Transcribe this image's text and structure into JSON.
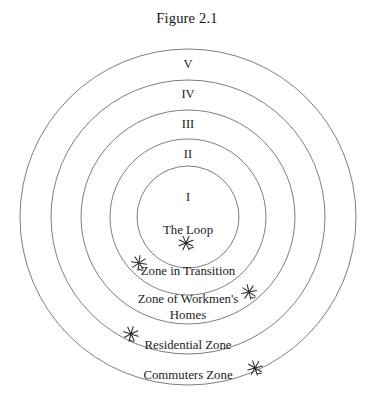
{
  "figure": {
    "title": "Figure 2.1",
    "diagram_type": "concentric-zone-model",
    "background_color": "#ffffff",
    "line_color": "#6e6e6e",
    "text_color": "#1b1b1b",
    "center": {
      "x": 188,
      "y": 217
    },
    "rings": [
      {
        "numeral": "I",
        "radius": 51,
        "numeral_x": 188,
        "numeral_y": 201,
        "zone_label": "The Loop",
        "label_lines": [
          "The Loop"
        ],
        "label_x": 188,
        "label_y": 234
      },
      {
        "numeral": "II",
        "radius": 78,
        "numeral_x": 188,
        "numeral_y": 158,
        "zone_label": "Zone in Transition",
        "label_lines": [
          "Zone in Transition"
        ],
        "label_x": 188,
        "label_y": 275
      },
      {
        "numeral": "III",
        "radius": 107,
        "numeral_x": 188,
        "numeral_y": 128,
        "zone_label": "Zone of Workmen's Homes",
        "label_lines": [
          "Zone of Workmen's",
          "Homes"
        ],
        "label_x": 188,
        "label_y": 307
      },
      {
        "numeral": "IV",
        "radius": 137,
        "numeral_x": 188,
        "numeral_y": 98,
        "zone_label": "Residential Zone",
        "label_lines": [
          "Residential Zone"
        ],
        "label_x": 188,
        "label_y": 349
      },
      {
        "numeral": "V",
        "radius": 168,
        "numeral_x": 188,
        "numeral_y": 68,
        "zone_label": "Commuters Zone",
        "label_lines": [
          "Commuters Zone"
        ],
        "label_x": 188,
        "label_y": 379
      }
    ],
    "star_marks": [
      {
        "name": "star-mark-the-loop",
        "x": 186,
        "y": 243,
        "size": 9,
        "rotation": -18
      },
      {
        "name": "star-mark-zone-in-transition",
        "x": 139,
        "y": 263,
        "size": 9,
        "rotation": 14
      },
      {
        "name": "star-mark-zone-of-workmens-homes",
        "x": 249,
        "y": 292,
        "size": 9,
        "rotation": -8
      },
      {
        "name": "star-mark-residential-zone",
        "x": 131,
        "y": 334,
        "size": 9,
        "rotation": 22
      },
      {
        "name": "star-mark-commuters-zone",
        "x": 255,
        "y": 368,
        "size": 9,
        "rotation": -12
      }
    ]
  }
}
